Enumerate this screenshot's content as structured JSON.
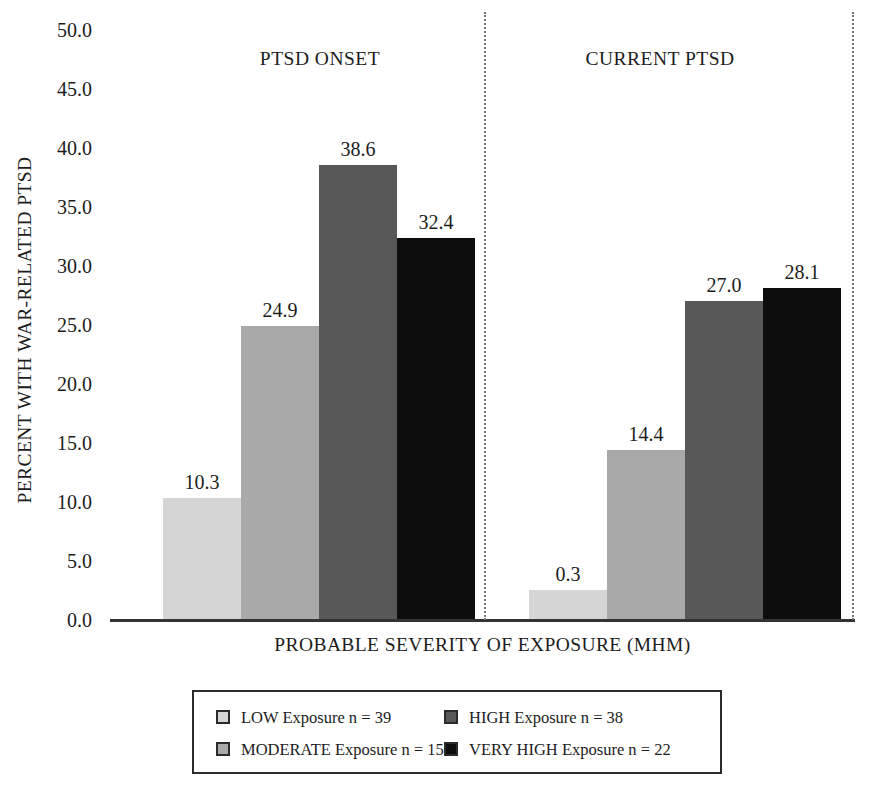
{
  "chart_data": {
    "type": "bar",
    "title": "",
    "xlabel": "PROBABLE SEVERITY OF EXPOSURE (MHM)",
    "ylabel": "PERCENT WITH WAR-RELATED PTSD",
    "ylim": [
      0,
      50
    ],
    "ytick_step": 5,
    "yticks": [
      "50.0",
      "45.0",
      "40.0",
      "35.0",
      "30.0",
      "25.0",
      "20.0",
      "15.0",
      "10.0",
      "5.0",
      "0.0"
    ],
    "grid": false,
    "legend_position": "bottom",
    "categories": [
      "PTSD ONSET",
      "CURRENT PTSD"
    ],
    "series": [
      {
        "name": "LOW Exposure",
        "n": 39,
        "color": "#d5d5d5",
        "values": [
          10.3,
          0.3
        ]
      },
      {
        "name": "MODERATE Exposure",
        "n": 159,
        "color": "#a9a9a9",
        "values": [
          24.9,
          14.4
        ]
      },
      {
        "name": "HIGH Exposure",
        "n": 38,
        "color": "#585858",
        "values": [
          38.6,
          27.0
        ]
      },
      {
        "name": "VERY HIGH Exposure",
        "n": 22,
        "color": "#0d0d0d",
        "values": [
          32.4,
          28.1
        ]
      }
    ],
    "value_labels": {
      "group1": [
        "10.3",
        "24.9",
        "38.6",
        "32.4"
      ],
      "group2": [
        "0.3",
        "14.4",
        "27.0",
        "28.1"
      ]
    },
    "annotations": {
      "group_divider_note": "vertical dotted lines separate PTSD ONSET and CURRENT PTSD panels"
    }
  },
  "axis": {
    "y_title": "PERCENT WITH WAR-RELATED PTSD",
    "x_title": "PROBABLE SEVERITY OF EXPOSURE (MHM)",
    "y_ticks": [
      "50.0",
      "45.0",
      "40.0",
      "35.0",
      "30.0",
      "25.0",
      "20.0",
      "15.0",
      "10.0",
      "5.0",
      "0.0"
    ]
  },
  "groups": [
    {
      "label": "PTSD ONSET"
    },
    {
      "label": "CURRENT PTSD"
    }
  ],
  "bars": {
    "group1": [
      {
        "label": "10.3",
        "value": 10.3,
        "color": "#d5d5d5"
      },
      {
        "label": "24.9",
        "value": 24.9,
        "color": "#a9a9a9"
      },
      {
        "label": "38.6",
        "value": 38.6,
        "color": "#585858"
      },
      {
        "label": "32.4",
        "value": 32.4,
        "color": "#0d0d0d"
      }
    ],
    "group2": [
      {
        "label": "0.3",
        "value": 0.3,
        "color": "#d5d5d5"
      },
      {
        "label": "14.4",
        "value": 14.4,
        "color": "#a9a9a9"
      },
      {
        "label": "27.0",
        "value": 27.0,
        "color": "#585858"
      },
      {
        "label": "28.1",
        "value": 28.1,
        "color": "#0d0d0d"
      }
    ]
  },
  "legend": {
    "items": [
      {
        "text": "LOW Exposure  n = 39",
        "color": "#d5d5d5"
      },
      {
        "text": "HIGH Exposure  n = 38",
        "color": "#585858"
      },
      {
        "text": "MODERATE Exposure  n = 159",
        "color": "#a9a9a9"
      },
      {
        "text": "VERY HIGH Exposure  n = 22",
        "color": "#0d0d0d"
      }
    ]
  }
}
